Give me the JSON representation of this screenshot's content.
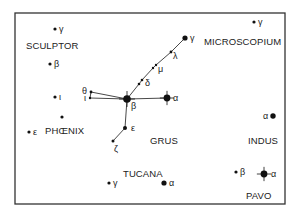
{
  "constellations": [
    {
      "name": "SCULPTOR",
      "x": 26,
      "y": 49
    },
    {
      "name": "MICROSCOPIUM",
      "x": 204,
      "y": 45
    },
    {
      "name": "GRUS",
      "x": 150,
      "y": 144
    },
    {
      "name": "PHŒNIX",
      "x": 45,
      "y": 134
    },
    {
      "name": "INDUS",
      "x": 248,
      "y": 144
    },
    {
      "name": "TUCANA",
      "x": 123,
      "y": 177
    },
    {
      "name": "PAVO",
      "x": 246,
      "y": 199
    }
  ],
  "stars": [
    {
      "id": "scl-gamma",
      "label": "γ",
      "x": 55,
      "y": 29,
      "r": 1.6,
      "lx": 59,
      "ly": 32
    },
    {
      "id": "scl-beta",
      "label": "β",
      "x": 50,
      "y": 64,
      "r": 1.6,
      "lx": 54,
      "ly": 67
    },
    {
      "id": "scl-iota",
      "label": "ι",
      "x": 55,
      "y": 97,
      "r": 1.6,
      "lx": 59,
      "ly": 100
    },
    {
      "id": "phe-unnamed",
      "label": "",
      "x": 62,
      "y": 117,
      "r": 1.6,
      "lx": 0,
      "ly": 0
    },
    {
      "id": "phe-epsilon",
      "label": "ε",
      "x": 29,
      "y": 132,
      "r": 1.6,
      "lx": 33,
      "ly": 135
    },
    {
      "id": "mic-gamma",
      "label": "γ",
      "x": 254,
      "y": 22,
      "r": 1.6,
      "lx": 258,
      "ly": 25
    },
    {
      "id": "gru-gamma",
      "label": "γ",
      "x": 185,
      "y": 38,
      "r": 2.6,
      "lx": 190,
      "ly": 41
    },
    {
      "id": "gru-lambda",
      "label": "λ",
      "x": 171,
      "y": 52,
      "r": 1.4,
      "lx": 173,
      "ly": 59
    },
    {
      "id": "gru-mu1",
      "label": "",
      "x": 156,
      "y": 65,
      "r": 1.2,
      "lx": 0,
      "ly": 0
    },
    {
      "id": "gru-mu2",
      "label": "μ",
      "x": 153,
      "y": 68,
      "r": 1.2,
      "lx": 158,
      "ly": 72
    },
    {
      "id": "gru-delta1",
      "label": "",
      "x": 142,
      "y": 80,
      "r": 1.3,
      "lx": 0,
      "ly": 0
    },
    {
      "id": "gru-delta2",
      "label": "δ",
      "x": 139,
      "y": 84,
      "r": 1.3,
      "lx": 145,
      "ly": 86
    },
    {
      "id": "gru-theta",
      "label": "θ",
      "x": 91,
      "y": 92,
      "r": 1.4,
      "lx": 82,
      "ly": 94
    },
    {
      "id": "gru-iota",
      "label": "ι",
      "x": 90,
      "y": 98,
      "r": 1.2,
      "lx": 84,
      "ly": 101
    },
    {
      "id": "gru-beta",
      "label": "β",
      "x": 127,
      "y": 99,
      "r": 3.8,
      "lx": 131,
      "ly": 109
    },
    {
      "id": "gru-alpha",
      "label": "α",
      "x": 167,
      "y": 98,
      "r": 3.4,
      "lx": 173,
      "ly": 101
    },
    {
      "id": "gru-epsilon",
      "label": "ε",
      "x": 125,
      "y": 128,
      "r": 2.0,
      "lx": 131,
      "ly": 131
    },
    {
      "id": "gru-zeta",
      "label": "ζ",
      "x": 113,
      "y": 141,
      "r": 1.5,
      "lx": 114,
      "ly": 152
    },
    {
      "id": "ind-alpha",
      "label": "α",
      "x": 273,
      "y": 116,
      "r": 2.7,
      "lx": 263,
      "ly": 119
    },
    {
      "id": "tuc-gamma",
      "label": "γ",
      "x": 109,
      "y": 183,
      "r": 1.6,
      "lx": 113,
      "ly": 186
    },
    {
      "id": "tuc-alpha",
      "label": "α",
      "x": 164,
      "y": 183,
      "r": 2.6,
      "lx": 169,
      "ly": 186
    },
    {
      "id": "pav-beta",
      "label": "β",
      "x": 236,
      "y": 172,
      "r": 1.6,
      "lx": 240,
      "ly": 175
    },
    {
      "id": "pav-alpha",
      "label": "α",
      "x": 264,
      "y": 174,
      "r": 3.4,
      "lx": 271,
      "ly": 177
    }
  ],
  "lines": [
    [
      "gru-gamma",
      "gru-lambda"
    ],
    [
      "gru-lambda",
      "gru-mu1"
    ],
    [
      "gru-mu1",
      "gru-mu2"
    ],
    [
      "gru-mu2",
      "gru-delta1"
    ],
    [
      "gru-delta1",
      "gru-delta2"
    ],
    [
      "gru-delta2",
      "gru-beta"
    ],
    [
      "gru-beta",
      "gru-alpha"
    ],
    [
      "gru-beta",
      "gru-theta"
    ],
    [
      "gru-beta",
      "gru-iota"
    ],
    [
      "gru-theta",
      "gru-iota"
    ],
    [
      "gru-beta",
      "gru-epsilon"
    ],
    [
      "gru-epsilon",
      "gru-zeta"
    ]
  ],
  "bright_stars_with_spikes": [
    "gru-beta",
    "gru-alpha",
    "pav-alpha"
  ],
  "frame": {
    "x": 15,
    "y": 13,
    "width": 270,
    "height": 191,
    "stroke": "#333333"
  },
  "colors": {
    "ink": "#111111",
    "background": "#ffffff"
  }
}
